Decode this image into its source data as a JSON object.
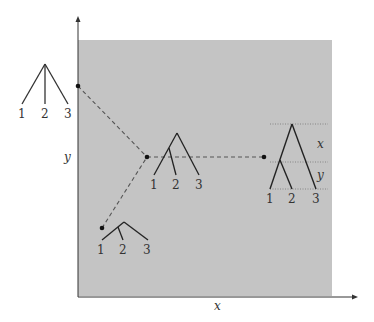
{
  "figure": {
    "region_color": "#c4c4c4",
    "axis_color": "#333333",
    "axes": {
      "x_label": "x",
      "y_label": "y"
    },
    "trees": {
      "star": {
        "leaves": [
          "1",
          "2",
          "3"
        ]
      },
      "bottom": {
        "leaves": [
          "1",
          "2",
          "3"
        ]
      },
      "center": {
        "leaves": [
          "1",
          "2",
          "3"
        ]
      },
      "right": {
        "leaves": [
          "1",
          "2",
          "3"
        ],
        "branch_labels": {
          "upper": "x",
          "lower": "y"
        }
      }
    }
  }
}
